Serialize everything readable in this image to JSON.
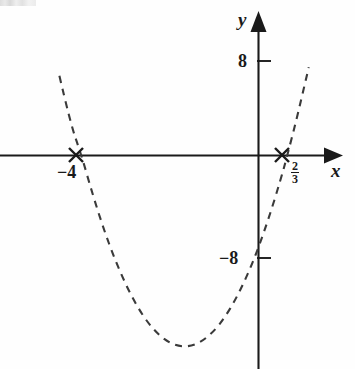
{
  "figure": {
    "title": "",
    "background_color": "#fefefe",
    "ink_color": "#1a1a1a"
  },
  "axes": {
    "x_axis_label": "x",
    "y_axis_label": "y",
    "x_axis_name": "x-axis",
    "y_axis_name": "y-axis",
    "arrow_style": "solid filled triangle",
    "origin_px": {
      "x": 258,
      "y": 155
    }
  },
  "tick_labels": {
    "y_positive": "8",
    "y_negative": "−8",
    "x_negative_root": "−4",
    "x_positive_root_numerator": "2",
    "x_positive_root_denominator": "3"
  },
  "markers": [
    {
      "name": "root-marker-left",
      "label": "−4",
      "x_value": -4,
      "y_value": 0,
      "glyph": "×"
    },
    {
      "name": "root-marker-right",
      "label": "2/3",
      "x_value": 0.6667,
      "y_value": 0,
      "glyph": "×"
    }
  ],
  "chart_data": {
    "type": "line",
    "title": "",
    "xlabel": "x",
    "ylabel": "y",
    "grid": false,
    "legend": false,
    "line_style": "dashed",
    "curve": "parabola",
    "equation": "y = 3x^2 + 10x - 8",
    "roots": [
      -4,
      0.6667
    ],
    "root_labels": [
      "−4",
      "2/3"
    ],
    "y_intercept": -8,
    "vertex": {
      "x": -1.667,
      "y": -16.33
    },
    "xlim": [
      -5.7,
      2.1
    ],
    "ylim": [
      -18.2,
      12.2
    ],
    "yticks": [
      8,
      -8
    ],
    "ytick_labels": [
      "8",
      "−8"
    ],
    "xticks": [
      -4,
      0.6667
    ],
    "xtick_labels": [
      "−4",
      "2/3"
    ],
    "x": [
      -5.05,
      -4.8,
      -4.5,
      -4.25,
      -4.0,
      -3.75,
      -3.5,
      -3.25,
      -3.0,
      -2.75,
      -2.5,
      -2.25,
      -2.0,
      -1.75,
      -1.5,
      -1.25,
      -1.0,
      -0.75,
      -0.5,
      -0.25,
      0.0,
      0.25,
      0.5,
      0.667,
      0.9,
      1.15,
      1.4,
      1.65
    ],
    "y": [
      18.0,
      13.12,
      6.75,
      2.69,
      0.0,
      -3.31,
      -6.25,
      -8.81,
      -11.0,
      -12.81,
      -14.25,
      -15.31,
      -16.0,
      -16.31,
      -16.25,
      -15.81,
      -15.0,
      -13.81,
      -12.25,
      -10.31,
      -8.0,
      -5.31,
      -2.25,
      0.0,
      3.43,
      7.47,
      11.68,
      16.33
    ]
  }
}
